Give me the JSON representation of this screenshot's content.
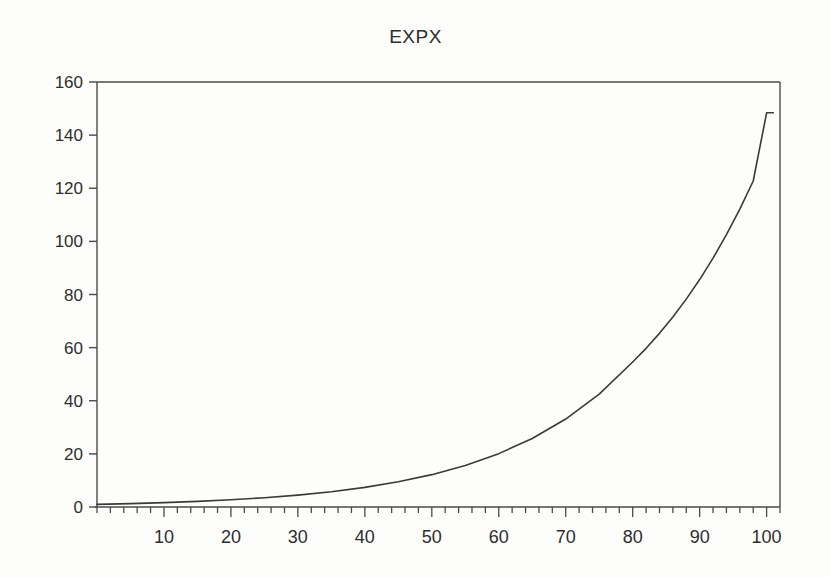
{
  "chart_data": {
    "type": "line",
    "title": "EXPX",
    "xlabel": "",
    "ylabel": "",
    "xlim": [
      0,
      102
    ],
    "ylim": [
      0,
      160
    ],
    "grid": false,
    "legend": null,
    "x_ticks_major": [
      10,
      20,
      30,
      40,
      50,
      60,
      70,
      80,
      90,
      100
    ],
    "x_tick_labels": [
      "10",
      "20",
      "30",
      "40",
      "50",
      "60",
      "70",
      "80",
      "90",
      "100"
    ],
    "x_minor_tick_step": 2,
    "y_ticks_major": [
      0,
      20,
      40,
      60,
      80,
      100,
      120,
      140,
      160
    ],
    "y_tick_labels": [
      "0",
      "20",
      "40",
      "60",
      "80",
      "100",
      "120",
      "140",
      "160"
    ],
    "series": [
      {
        "name": "EXPX",
        "color": "#3a3a3a",
        "x": [
          0,
          5,
          10,
          15,
          20,
          25,
          30,
          35,
          40,
          45,
          50,
          55,
          60,
          65,
          70,
          75,
          80,
          82,
          84,
          86,
          88,
          90,
          92,
          94,
          96,
          98,
          100,
          101
        ],
        "values": [
          1,
          1.28,
          1.65,
          2.12,
          2.72,
          3.49,
          4.48,
          5.75,
          7.39,
          9.49,
          12.18,
          15.64,
          20.09,
          25.79,
          33.12,
          42.52,
          54.6,
          59.74,
          65.37,
          71.52,
          78.26,
          85.62,
          93.69,
          102.51,
          112.17,
          122.73,
          148.41,
          148.41
        ]
      }
    ]
  },
  "figure": {
    "background_color": "#fdfdfc",
    "axis_color": "#4a4a4a",
    "text_color": "#2e2e2e"
  }
}
